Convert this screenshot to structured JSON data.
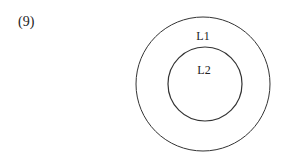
{
  "figure": {
    "number_label": "(9)",
    "outer_circle": {
      "label": "L1",
      "cx": 203,
      "cy": 84,
      "r": 67
    },
    "inner_circle": {
      "label": "L2",
      "cx": 205,
      "cy": 84,
      "r": 37
    },
    "stroke_color": "#333333"
  }
}
